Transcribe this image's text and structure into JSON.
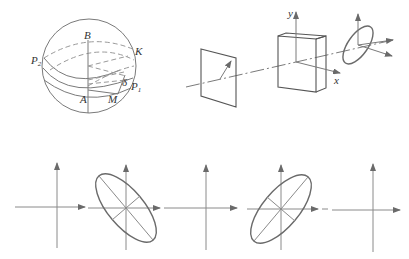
{
  "figure": {
    "poincare_sphere": {
      "labels": {
        "B": "B",
        "A": "A",
        "M": "M",
        "K": "K",
        "P2": "P",
        "P2_sub": "2",
        "P1": "P",
        "P1_sub": "1",
        "delta": "δ"
      }
    },
    "optical_setup": {
      "axis_labels": {
        "y": "y",
        "x": "x"
      },
      "components": [
        "polarizer-plate",
        "wave-plate-crystal",
        "output-polarization-ellipse"
      ]
    },
    "polarization_sequence": {
      "states": [
        {
          "name": "linear-vertical-horizontal",
          "ellipse": false
        },
        {
          "name": "elliptical-tilted-left",
          "ellipse": true,
          "tilt_deg": -55
        },
        {
          "name": "linear",
          "ellipse": false
        },
        {
          "name": "elliptical-tilted-right",
          "ellipse": true,
          "tilt_deg": 55
        },
        {
          "name": "linear",
          "ellipse": false
        }
      ]
    },
    "colors": {
      "line": "#7a7a7a",
      "dark_line": "#555555",
      "dashed": "#9a9a9a",
      "text": "#333333"
    }
  }
}
